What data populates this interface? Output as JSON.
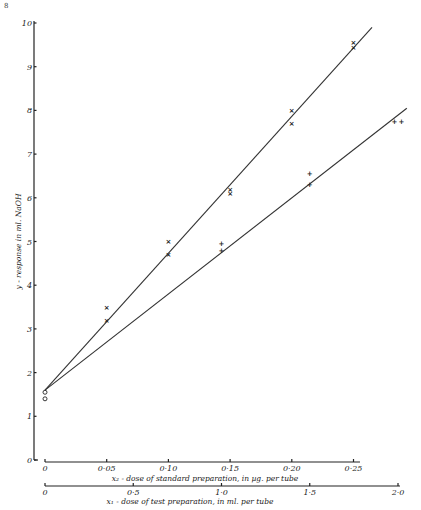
{
  "page": {
    "corner_mark": "8"
  },
  "chart_data": {
    "type": "scatter",
    "title": "",
    "ylabel": "y - response in ml. NaOH",
    "ylim": [
      0,
      10
    ],
    "yticks": [
      0,
      1,
      2,
      3,
      4,
      5,
      6,
      7,
      8,
      9,
      10
    ],
    "ytick_labels": [
      "0",
      "1",
      "2",
      "3",
      "4",
      "5",
      "6",
      "7",
      "8",
      "9",
      "10"
    ],
    "x_axes": [
      {
        "id": "x2",
        "label": "x₂ - dose of standard preparation, in µg. per tube",
        "lim": [
          0,
          0.26
        ],
        "ticks": [
          0,
          0.05,
          0.1,
          0.15,
          0.2,
          0.25
        ],
        "tick_labels": [
          "0",
          "0·05",
          "0·10",
          "0·15",
          "0·20",
          "0·25"
        ]
      },
      {
        "id": "x1",
        "label": "x₁ - dose of test preparation, in ml. per tube",
        "lim": [
          0,
          2.0
        ],
        "ticks": [
          0,
          0.5,
          1.0,
          1.5,
          2.0
        ],
        "tick_labels": [
          "0",
          "0·5",
          "1·0",
          "1·5",
          "2·0"
        ]
      }
    ],
    "grid": false,
    "series": [
      {
        "name": "standard preparation",
        "axis": "x2",
        "marker": "×",
        "points": [
          {
            "x": 0.05,
            "y": 3.5
          },
          {
            "x": 0.05,
            "y": 3.2
          },
          {
            "x": 0.1,
            "y": 5.0
          },
          {
            "x": 0.1,
            "y": 4.7
          },
          {
            "x": 0.15,
            "y": 6.2
          },
          {
            "x": 0.15,
            "y": 6.1
          },
          {
            "x": 0.2,
            "y": 8.0
          },
          {
            "x": 0.2,
            "y": 7.7
          },
          {
            "x": 0.25,
            "y": 9.55
          },
          {
            "x": 0.25,
            "y": 9.45
          }
        ],
        "fit_line": {
          "x": [
            0,
            0.265
          ],
          "y": [
            1.6,
            9.9
          ]
        }
      },
      {
        "name": "test preparation",
        "axis": "x1",
        "marker": "+",
        "points": [
          {
            "x": 1.0,
            "y": 4.95
          },
          {
            "x": 1.0,
            "y": 4.8
          },
          {
            "x": 1.5,
            "y": 6.55
          },
          {
            "x": 1.5,
            "y": 6.3
          },
          {
            "x": 1.98,
            "y": 7.75
          },
          {
            "x": 2.02,
            "y": 7.75
          }
        ],
        "fit_line": {
          "x": [
            0,
            2.05
          ],
          "y": [
            1.6,
            8.05
          ]
        }
      },
      {
        "name": "zero dose (blank)",
        "axis": "x2",
        "marker": "o",
        "points": [
          {
            "x": 0,
            "y": 1.55
          },
          {
            "x": 0,
            "y": 1.4
          }
        ]
      }
    ]
  }
}
